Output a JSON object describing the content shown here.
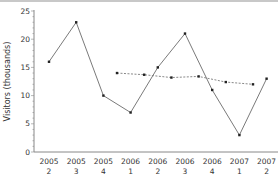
{
  "chart_data": {
    "type": "line",
    "title": "",
    "xlabel": "",
    "ylabel": "Visitors (thousands)",
    "ylim": [
      0,
      25
    ],
    "yticks": [
      0,
      5,
      10,
      15,
      20,
      25
    ],
    "grid": false,
    "legend": null,
    "categories": [
      [
        "2005",
        "2"
      ],
      [
        "2005",
        "3"
      ],
      [
        "2005",
        "4"
      ],
      [
        "2006",
        "1"
      ],
      [
        "2006",
        "2"
      ],
      [
        "2006",
        "3"
      ],
      [
        "2006",
        "4"
      ],
      [
        "2007",
        "1"
      ],
      [
        "2007",
        "2"
      ]
    ],
    "series": [
      {
        "name": "Visitors",
        "style": "solid",
        "values": [
          16,
          23,
          10,
          7,
          15,
          21,
          11,
          3,
          13
        ]
      },
      {
        "name": "Moving average",
        "style": "dashed",
        "x_offset": 0.5,
        "values": [
          null,
          null,
          14,
          13.7,
          13.2,
          13.4,
          12.4,
          12,
          null
        ]
      }
    ]
  },
  "colors": {
    "line": "#7a7a7a",
    "marker": "#222222",
    "axis": "#888888",
    "text": "#333333"
  }
}
